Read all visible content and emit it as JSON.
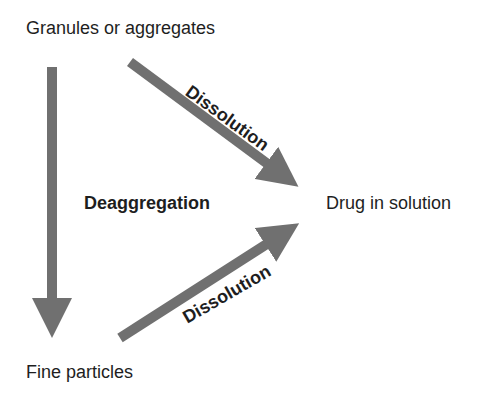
{
  "nodes": {
    "top": "Granules or aggregates",
    "right": "Drug in solution",
    "bottom": "Fine particles"
  },
  "edges": {
    "vertical": "Deaggregation",
    "upper_diagonal": "Dissolution",
    "lower_diagonal": "Dissolution"
  },
  "colors": {
    "arrow": "#707070",
    "text": "#1e1e1e",
    "background": "#ffffff"
  }
}
